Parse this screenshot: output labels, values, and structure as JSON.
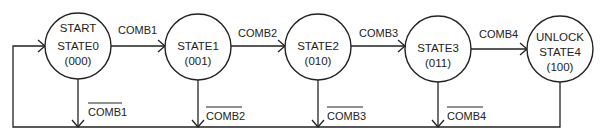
{
  "diagram": {
    "type": "state-machine",
    "states": [
      {
        "id": "s0",
        "lines": [
          "START",
          "STATE0",
          "(000)"
        ],
        "cx": 78
      },
      {
        "id": "s1",
        "lines": [
          "STATE1",
          "(001)"
        ],
        "cx": 198
      },
      {
        "id": "s2",
        "lines": [
          "STATE2",
          "(010)"
        ],
        "cx": 318
      },
      {
        "id": "s3",
        "lines": [
          "STATE3",
          "(011)"
        ],
        "cx": 438
      },
      {
        "id": "s4",
        "lines": [
          "UNLOCK",
          "STATE4",
          "(100)"
        ],
        "cx": 560
      }
    ],
    "forward_transitions": [
      {
        "from": "s0",
        "to": "s1",
        "label": "COMB1"
      },
      {
        "from": "s1",
        "to": "s2",
        "label": "COMB2"
      },
      {
        "from": "s2",
        "to": "s3",
        "label": "COMB3"
      },
      {
        "from": "s3",
        "to": "s4",
        "label": "COMB4"
      }
    ],
    "return_transitions": [
      {
        "from": "s0",
        "to": "s0",
        "label": "COMB1",
        "negated": true
      },
      {
        "from": "s1",
        "to": "s0",
        "label": "COMB2",
        "negated": true
      },
      {
        "from": "s2",
        "to": "s0",
        "label": "COMB3",
        "negated": true
      },
      {
        "from": "s3",
        "to": "s0",
        "label": "COMB4",
        "negated": true
      },
      {
        "from": "s4",
        "to": "s0",
        "label": "",
        "negated": false
      }
    ]
  }
}
